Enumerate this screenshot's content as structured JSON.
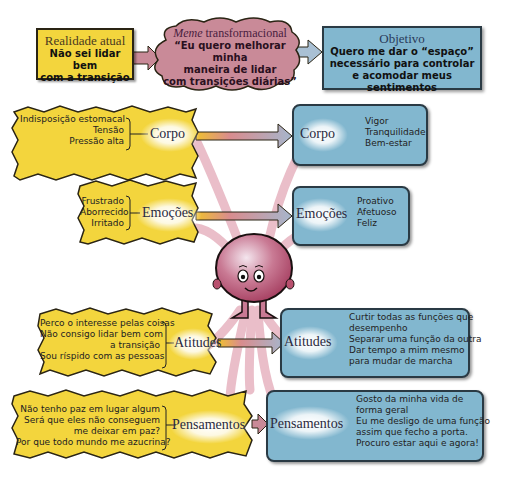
{
  "top": {
    "current": {
      "title": "Realidade atual",
      "text_line1": "Não sei lidar bem",
      "text_line2": "com a transição"
    },
    "meme": {
      "title_italic": "Meme",
      "title_rest": " transformacional",
      "line1": "“Eu quero melhorar minha",
      "line2": "maneira de lidar",
      "line3": "com transições diárias”"
    },
    "goal": {
      "title": "Objetivo",
      "line1": "Quero me dar o “espaço”",
      "line2": "necessário para controlar",
      "line3": "e acomodar meus sentimentos"
    }
  },
  "left": {
    "corpo": {
      "label": "Corpo",
      "items": [
        "Indisposição estomacal",
        "Tensão",
        "Pressão alta"
      ]
    },
    "emocoes": {
      "label": "Emoções",
      "items": [
        "Frustrado",
        "Aborrecido",
        "Irritado"
      ]
    },
    "atitudes": {
      "label": "Atitudes",
      "items": [
        "Perco o interesse pelas coisas",
        "Não consigo lidar bem com",
        "a transição",
        "Sou ríspido com as pessoas"
      ]
    },
    "pensamentos": {
      "label": "Pensamentos",
      "items": [
        "Não tenho paz em lugar algum",
        "Será que eles não conseguem",
        "me deixar em paz?",
        "Por que todo mundo me azucrina?"
      ]
    }
  },
  "right": {
    "corpo": {
      "label": "Corpo",
      "items": [
        "Vigor",
        "Tranquilidade",
        "Bem-estar"
      ]
    },
    "emocoes": {
      "label": "Emoções",
      "items": [
        "Proativo",
        "Afetuoso",
        "Feliz"
      ]
    },
    "atitudes": {
      "label": "Atitudes",
      "items": [
        "Curtir todas as funções que",
        "desempenho",
        "Separar uma função da outra",
        "Dar tempo a mim mesmo",
        "para mudar de marcha"
      ]
    },
    "pensamentos": {
      "label": "Pensamentos",
      "items": [
        "Gosto da minha vida de",
        "forma geral",
        "Eu me desligo de uma função",
        "assim que fecho a porta.",
        "Procuro estar aqui e agora!"
      ]
    }
  },
  "colors": {
    "yellow": "#f3d53d",
    "blue": "#82b7cf",
    "pink": "#c98a98",
    "character": "#b8506e"
  }
}
